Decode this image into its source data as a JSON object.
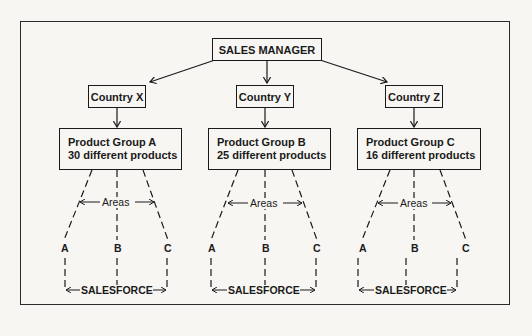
{
  "diagram": {
    "root": {
      "label": "SALES MANAGER"
    },
    "branches": [
      {
        "country": "Country X",
        "group_line1": "Product Group A",
        "group_line2": "30 different products",
        "areas_label": "Areas",
        "areas": [
          "A",
          "B",
          "C"
        ],
        "salesforce_label": "SALESFORCE"
      },
      {
        "country": "Country Y",
        "group_line1": "Product Group B",
        "group_line2": "25 different products",
        "areas_label": "Areas",
        "areas": [
          "A",
          "B",
          "C"
        ],
        "salesforce_label": "SALESFORCE"
      },
      {
        "country": "Country Z",
        "group_line1": "Product Group C",
        "group_line2": "16 different products",
        "areas_label": "Areas",
        "areas": [
          "A",
          "B",
          "C"
        ],
        "salesforce_label": "SALESFORCE"
      }
    ]
  }
}
